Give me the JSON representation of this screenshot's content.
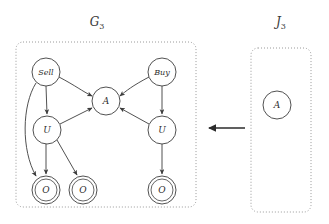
{
  "figure": {
    "width": 329,
    "height": 224,
    "background_color": "#ffffff",
    "stroke_color": "#3d3d3d",
    "box_stroke_color": "#9a9a9a"
  },
  "panels": [
    {
      "id": "G3",
      "label_base": "G",
      "label_sub": "3",
      "label_x": 97,
      "label_y": 26,
      "box": {
        "x": 16,
        "y": 42,
        "width": 180,
        "height": 165,
        "radius": 7
      }
    },
    {
      "id": "J3",
      "label_base": "J",
      "label_sub": "3",
      "label_x": 281,
      "label_y": 26,
      "box": {
        "x": 251,
        "y": 48,
        "width": 60,
        "height": 164,
        "radius": 7
      }
    }
  ],
  "nodes": [
    {
      "id": "sell",
      "panel": "G3",
      "label": "Sell",
      "cx": 46,
      "cy": 72,
      "r": 14,
      "double": false,
      "font": "small"
    },
    {
      "id": "buy",
      "panel": "G3",
      "label": "Buy",
      "cx": 162,
      "cy": 72,
      "r": 14,
      "double": false,
      "font": "small"
    },
    {
      "id": "a_g3",
      "panel": "G3",
      "label": "A",
      "cx": 106,
      "cy": 101,
      "r": 14,
      "double": false,
      "font": "mid"
    },
    {
      "id": "u_left",
      "panel": "G3",
      "label": "U",
      "cx": 47,
      "cy": 130,
      "r": 14,
      "double": false,
      "font": "mid"
    },
    {
      "id": "u_right",
      "panel": "G3",
      "label": "U",
      "cx": 162,
      "cy": 130,
      "r": 14,
      "double": false,
      "font": "mid"
    },
    {
      "id": "o1",
      "panel": "G3",
      "label": "O",
      "cx": 46,
      "cy": 190,
      "r": 14,
      "double": true,
      "font": "mid"
    },
    {
      "id": "o2",
      "panel": "G3",
      "label": "O",
      "cx": 83,
      "cy": 190,
      "r": 14,
      "double": true,
      "font": "mid"
    },
    {
      "id": "o3",
      "panel": "G3",
      "label": "O",
      "cx": 162,
      "cy": 190,
      "r": 14,
      "double": true,
      "font": "mid"
    },
    {
      "id": "a_j3",
      "panel": "J3",
      "label": "A",
      "cx": 277,
      "cy": 105,
      "r": 14,
      "double": false,
      "font": "mid"
    }
  ],
  "edges": [
    {
      "id": "sell-to-a",
      "from": "sell",
      "to": "a_g3",
      "path": "M 59 77 C 76 86 82 91 92 96",
      "arrow": true
    },
    {
      "id": "buy-to-a",
      "from": "buy",
      "to": "a_g3",
      "path": "M 149 77 C 132 86 126 91 120 96",
      "arrow": true
    },
    {
      "id": "sell-to-uleft",
      "from": "sell",
      "to": "u_left",
      "path": "M 46 86 L 47 114",
      "arrow": true
    },
    {
      "id": "buy-to-uright",
      "from": "buy",
      "to": "u_right",
      "path": "M 162 86 L 162 114",
      "arrow": true
    },
    {
      "id": "uleft-to-a",
      "from": "u_left",
      "to": "a_g3",
      "path": "M 60 124 L 92 108",
      "arrow": true
    },
    {
      "id": "uright-to-a",
      "from": "u_right",
      "to": "a_g3",
      "path": "M 149 124 L 120 108",
      "arrow": true
    },
    {
      "id": "uleft-to-o1",
      "from": "u_left",
      "to": "o1",
      "path": "M 46 144 L 46 174",
      "arrow": true
    },
    {
      "id": "uleft-to-o2",
      "from": "u_left",
      "to": "o2",
      "path": "M 57 140 L 77 175",
      "arrow": true
    },
    {
      "id": "uright-to-o3",
      "from": "u_right",
      "to": "o3",
      "path": "M 162 144 L 162 174",
      "arrow": true
    },
    {
      "id": "sell-to-o1",
      "from": "sell",
      "to": "o1",
      "path": "M 36 83 C 22 105 21 150 36 176",
      "arrow": true
    }
  ],
  "transform_arrow": {
    "id": "j3-to-g3-arrow",
    "label": "",
    "from_x": 245,
    "to_x": 207,
    "y": 128,
    "direction": "left"
  }
}
